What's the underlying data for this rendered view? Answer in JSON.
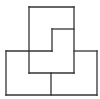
{
  "diagram": {
    "stroke_color": "#333333",
    "background": "#ffffff",
    "segments": [
      {
        "x1": 29,
        "y1": 7,
        "x2": 74,
        "y2": 7
      },
      {
        "x1": 29,
        "y1": 7,
        "x2": 29,
        "y2": 73
      },
      {
        "x1": 74,
        "y1": 7,
        "x2": 74,
        "y2": 73
      },
      {
        "x1": 52,
        "y1": 29,
        "x2": 74,
        "y2": 29
      },
      {
        "x1": 52,
        "y1": 29,
        "x2": 52,
        "y2": 51
      },
      {
        "x1": 6,
        "y1": 51,
        "x2": 52,
        "y2": 51
      },
      {
        "x1": 74,
        "y1": 51,
        "x2": 97,
        "y2": 51
      },
      {
        "x1": 6,
        "y1": 51,
        "x2": 6,
        "y2": 95
      },
      {
        "x1": 97,
        "y1": 51,
        "x2": 97,
        "y2": 95
      },
      {
        "x1": 29,
        "y1": 73,
        "x2": 74,
        "y2": 73
      },
      {
        "x1": 51,
        "y1": 73,
        "x2": 51,
        "y2": 95
      },
      {
        "x1": 6,
        "y1": 95,
        "x2": 97,
        "y2": 95
      }
    ]
  }
}
